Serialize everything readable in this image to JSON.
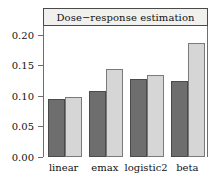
{
  "chart_data": {
    "type": "bar",
    "title": "Dose−response estimation",
    "xlabel": "",
    "ylabel": "",
    "categories": [
      "linear",
      "emax",
      "logistic2",
      "beta"
    ],
    "series": [
      {
        "name": "series-1-dark",
        "color": "#6e6e6e",
        "values": [
          0.095,
          0.108,
          0.128,
          0.125
        ]
      },
      {
        "name": "series-2-light",
        "color": "#d6d6d6",
        "values": [
          0.099,
          0.144,
          0.134,
          0.187
        ]
      }
    ],
    "ylim": [
      0.0,
      0.215
    ],
    "yticks": [
      0.0,
      0.05,
      0.1,
      0.15,
      0.2
    ],
    "ytick_labels": [
      "0.00",
      "0.05",
      "0.10",
      "0.15",
      "0.20"
    ],
    "grid": false,
    "legend": "none"
  },
  "strip": {
    "label": "Dose−response estimation"
  }
}
